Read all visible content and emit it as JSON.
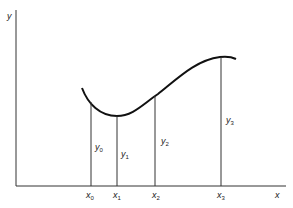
{
  "diagram": {
    "axes": {
      "x_label": "x",
      "y_label": "y"
    },
    "x_ticks": [
      {
        "name": "x",
        "sub": "0"
      },
      {
        "name": "x",
        "sub": "1"
      },
      {
        "name": "x",
        "sub": "2"
      },
      {
        "name": "x",
        "sub": "3"
      }
    ],
    "ordinates": [
      {
        "name": "y",
        "sub": "0"
      },
      {
        "name": "y",
        "sub": "1"
      },
      {
        "name": "y",
        "sub": "2"
      },
      {
        "name": "y",
        "sub": "3"
      }
    ],
    "colors": {
      "line": "#222222",
      "background": "#ffffff"
    }
  }
}
